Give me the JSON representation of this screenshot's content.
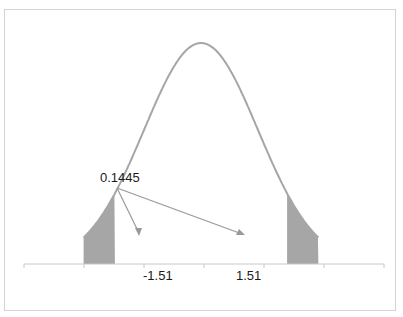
{
  "chart_data": {
    "type": "area",
    "title": "",
    "xlabel": "",
    "ylabel": "",
    "distribution": "normal",
    "mean": 0,
    "sd": 1,
    "xlim": [
      -4,
      4
    ],
    "shaded_regions": [
      {
        "from": -4,
        "to": -1.51,
        "side": "left"
      },
      {
        "from": 1.51,
        "to": 4,
        "side": "right"
      }
    ],
    "tick_labels": [
      "-1.51",
      "1.51"
    ],
    "tick_positions": [
      -1.51,
      1.51
    ],
    "annotation": {
      "text": "0.1445",
      "arrows_to": [
        "left-tail",
        "right-tail"
      ]
    },
    "grid": false,
    "legend": null,
    "colors": {
      "curve": "#a6a6a6",
      "fill": "#a6a6a6",
      "axis": "#c8c8c8",
      "arrow": "#999999"
    }
  }
}
